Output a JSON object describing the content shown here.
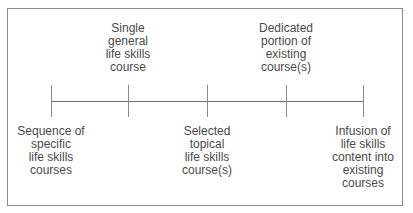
{
  "diagram": {
    "type": "continuum",
    "points": [
      {
        "label": "Sequence of specific life skills courses",
        "lines": [
          "Sequence of",
          "specific",
          "life skills",
          "courses"
        ],
        "position": "below"
      },
      {
        "label": "Single general life skills course",
        "lines": [
          "Single",
          "general",
          "life skills",
          "course"
        ],
        "position": "above"
      },
      {
        "label": "Selected topical life skills course(s)",
        "lines": [
          "Selected",
          "topical",
          "life skills",
          "course(s)"
        ],
        "position": "below"
      },
      {
        "label": "Dedicated portion of existing course(s)",
        "lines": [
          "Dedicated",
          "portion of",
          "existing",
          "course(s)"
        ],
        "position": "above"
      },
      {
        "label": "Infusion of life skills content into existing courses",
        "lines": [
          "Infusion of",
          "life skills",
          "content into",
          "existing",
          "courses"
        ],
        "position": "below"
      }
    ]
  }
}
